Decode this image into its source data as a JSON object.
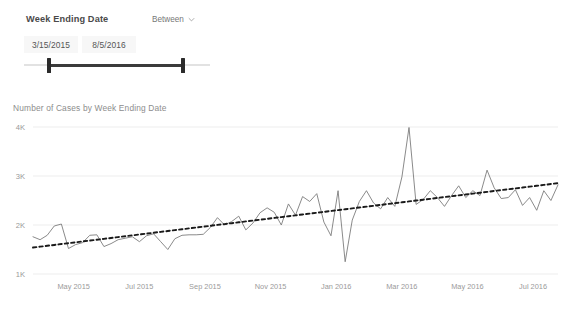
{
  "slicer": {
    "title": "Week Ending Date",
    "mode_label": "Between",
    "chevron_icon": "chevron-down-icon",
    "start_date": "3/15/2015",
    "end_date": "8/5/2016",
    "slider": {
      "left_handle_pct": 12.4,
      "right_handle_pct": 84.4
    }
  },
  "chart_card": {
    "title": "Number of Cases by Week Ending Date"
  },
  "colors": {
    "background": "#ffffff",
    "series_line": "#7d7d7d",
    "trend_line": "#1a1a1a",
    "gridline": "#ededed",
    "axis_text": "#999999",
    "title_text": "#8d8d8d",
    "slider_track": "#3b3b3b",
    "slider_rail": "#e2e2e2"
  },
  "chart_data": {
    "type": "line",
    "title": "Number of Cases by Week Ending Date",
    "xlabel": "Week Ending Date",
    "ylabel": "Number of Cases",
    "ylim": [
      1000,
      4000
    ],
    "ytick_labels": [
      "1K",
      "2K",
      "3K",
      "4K"
    ],
    "ytick_values": [
      1000,
      2000,
      3000,
      4000
    ],
    "xtick_labels": [
      "May 2015",
      "Jul 2015",
      "Sep 2015",
      "Nov 2015",
      "Jan 2016",
      "Mar 2016",
      "May 2016",
      "Jul 2016"
    ],
    "grid": true,
    "legend": false,
    "series": [
      {
        "name": "Number of Cases",
        "style": "solid",
        "values": [
          1760,
          1700,
          1790,
          1980,
          2020,
          1520,
          1600,
          1640,
          1790,
          1800,
          1560,
          1620,
          1700,
          1730,
          1760,
          1660,
          1780,
          1820,
          1660,
          1500,
          1720,
          1790,
          1800,
          1800,
          1810,
          1950,
          2150,
          2000,
          2070,
          2180,
          1900,
          2040,
          2250,
          2350,
          2260,
          2000,
          2430,
          2200,
          2580,
          2480,
          2640,
          2060,
          1780,
          2700,
          1250,
          2100,
          2480,
          2700,
          2450,
          2330,
          2560,
          2380,
          2980,
          3990,
          2420,
          2520,
          2700,
          2560,
          2380,
          2600,
          2800,
          2560,
          2700,
          2600,
          3120,
          2760,
          2540,
          2560,
          2720,
          2400,
          2560,
          2300,
          2700,
          2500,
          2820
        ]
      },
      {
        "name": "Trend",
        "style": "dashed",
        "values": [
          1540,
          1558,
          1576,
          1593,
          1611,
          1629,
          1647,
          1664,
          1682,
          1700,
          1718,
          1735,
          1753,
          1771,
          1789,
          1806,
          1824,
          1842,
          1860,
          1877,
          1895,
          1913,
          1931,
          1948,
          1966,
          1984,
          2002,
          2019,
          2037,
          2055,
          2073,
          2090,
          2108,
          2126,
          2144,
          2161,
          2179,
          2197,
          2215,
          2232,
          2250,
          2268,
          2286,
          2303,
          2321,
          2339,
          2357,
          2374,
          2392,
          2410,
          2428,
          2445,
          2463,
          2481,
          2499,
          2516,
          2534,
          2552,
          2570,
          2587,
          2605,
          2623,
          2641,
          2658,
          2676,
          2694,
          2712,
          2729,
          2747,
          2765,
          2783,
          2800,
          2818,
          2836,
          2854
        ]
      }
    ]
  }
}
